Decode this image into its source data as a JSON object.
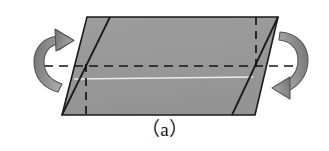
{
  "figure": {
    "caption": "（a）",
    "label_letter": "a",
    "background_color": "#ffffff",
    "body": {
      "name": "shaded-parallelogram",
      "fill_color": "#9a9a9a",
      "stroke_color": "#1a1a1a",
      "vertices": [
        {
          "x": 87,
          "y": 17
        },
        {
          "x": 278,
          "y": 17
        },
        {
          "x": 255,
          "y": 115
        },
        {
          "x": 62,
          "y": 115
        }
      ]
    },
    "edges": [
      {
        "name": "left-fold-edge",
        "from": {
          "x": 62,
          "y": 115
        },
        "to": {
          "x": 110,
          "y": 17
        },
        "style": "solid",
        "color": "#1a1a1a"
      },
      {
        "name": "right-fold-edge",
        "from": {
          "x": 232,
          "y": 115
        },
        "to": {
          "x": 278,
          "y": 17
        },
        "style": "solid",
        "color": "#1a1a1a"
      }
    ],
    "dashed_lines": [
      {
        "name": "horizontal-axis-line",
        "from": {
          "x": 44,
          "y": 66
        },
        "to": {
          "x": 296,
          "y": 66
        },
        "style": "dashed",
        "color": "#161616"
      },
      {
        "name": "left-vertical-dashed-line",
        "from": {
          "x": 86,
          "y": 66
        },
        "to": {
          "x": 86,
          "y": 115
        },
        "style": "dashed",
        "color": "#161616"
      },
      {
        "name": "right-vertical-dashed-line",
        "from": {
          "x": 256,
          "y": 17
        },
        "to": {
          "x": 256,
          "y": 66
        },
        "style": "dashed",
        "color": "#161616"
      }
    ],
    "highlight_line": {
      "name": "white-crease-line",
      "from": {
        "x": 74,
        "y": 79
      },
      "to": {
        "x": 253,
        "y": 77
      },
      "color": "#eeeae2"
    },
    "arrows": [
      {
        "name": "left-rotation-arrow",
        "direction": "counterclockwise",
        "head_position": "top",
        "color": "#7e7e7e",
        "outline_color": "#4a4a4a"
      },
      {
        "name": "right-rotation-arrow",
        "direction": "clockwise",
        "head_position": "bottom",
        "color": "#7e7e7e",
        "outline_color": "#4a4a4a"
      }
    ]
  }
}
